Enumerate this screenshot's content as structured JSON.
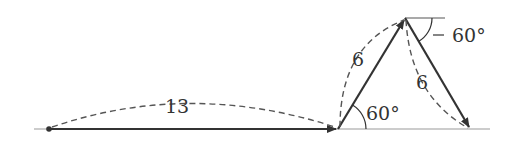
{
  "diagram": {
    "type": "vector-path",
    "segments": [
      {
        "label": "13",
        "from": [
          49,
          129
        ],
        "to": [
          338,
          129
        ]
      },
      {
        "label": "6",
        "from": [
          338,
          129
        ],
        "to": [
          405,
          18
        ]
      },
      {
        "label": "6",
        "from": [
          405,
          18
        ],
        "to": [
          470,
          129
        ]
      }
    ],
    "angles": [
      {
        "label": "60°",
        "at": "bottom-vertex"
      },
      {
        "label": "60°",
        "at": "apex"
      }
    ],
    "colors": {
      "stroke": "#333333",
      "baseline": "#999999",
      "dash": "#555555"
    }
  }
}
